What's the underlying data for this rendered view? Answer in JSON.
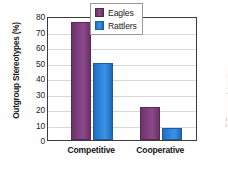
{
  "chart_data": {
    "type": "bar",
    "title": "",
    "xlabel": "",
    "ylabel": "Outgroup Stereotypes (%)",
    "categories": [
      "Competitive",
      "Cooperative"
    ],
    "series": [
      {
        "name": "Eagles",
        "color": "#7B3B7B",
        "values": [
          76,
          21.5
        ]
      },
      {
        "name": "Rattlers",
        "color": "#2B7FD4",
        "values": [
          50,
          8
        ]
      }
    ],
    "ylim": [
      0,
      80
    ],
    "ytick_step": 10,
    "yticks": [
      "80",
      "70",
      "60",
      "50",
      "40",
      "30",
      "20",
      "10",
      "0"
    ],
    "grid": true,
    "legend_position": "top-right"
  },
  "credit": "© Cengage Learning"
}
